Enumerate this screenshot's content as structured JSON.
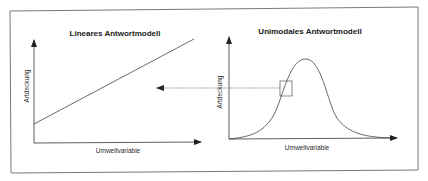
{
  "diagram": {
    "left_panel": {
      "title": "Lineares Antwortmodell",
      "y_axis_label": "Artdeckung",
      "x_axis_label": "Umweltvariable",
      "curve": "linear"
    },
    "right_panel": {
      "title": "Unimodales Antwortmodell",
      "y_axis_label": "Artdeckung",
      "x_axis_label": "Umweltvariable",
      "curve": "unimodal-bell"
    },
    "connector": {
      "style": "dotted-arrow",
      "from": "right_panel.highlight_box",
      "to": "left_panel"
    },
    "colors": {
      "stroke": "#3a3a3a",
      "frame": "#6a6a6a",
      "background": "#ffffff"
    }
  }
}
